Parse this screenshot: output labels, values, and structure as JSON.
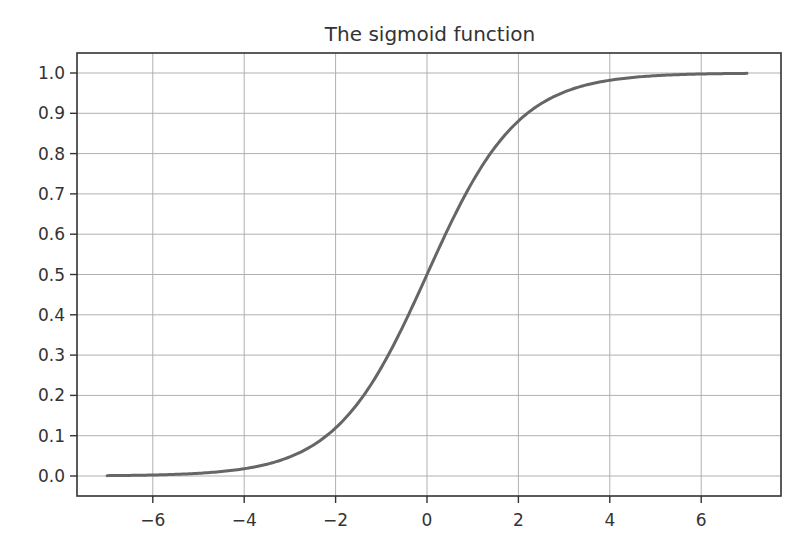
{
  "chart_data": {
    "type": "line",
    "title": "The sigmoid function",
    "xlabel": "",
    "ylabel": "",
    "xlim": [
      -7.5,
      7.6
    ],
    "ylim": [
      -0.05,
      1.05
    ],
    "grid": true,
    "legend": null,
    "x_ticks": [
      -6,
      -4,
      -2,
      0,
      2,
      4,
      6
    ],
    "x_tick_labels": [
      "−6",
      "−4",
      "−2",
      "0",
      "2",
      "4",
      "6"
    ],
    "y_ticks": [
      0.0,
      0.1,
      0.2,
      0.3,
      0.4,
      0.5,
      0.6,
      0.7,
      0.8,
      0.9,
      1.0
    ],
    "y_tick_labels": [
      "0.0",
      "0.1",
      "0.2",
      "0.3",
      "0.4",
      "0.5",
      "0.6",
      "0.7",
      "0.8",
      "0.9",
      "1.0"
    ],
    "series": [
      {
        "name": "sigmoid",
        "color": "#666666",
        "function": "1/(1+exp(-x))",
        "x": [
          -7,
          -6,
          -5,
          -4,
          -3,
          -2,
          -1,
          0,
          1,
          2,
          3,
          4,
          5,
          6,
          7
        ],
        "values": [
          0.001,
          0.002,
          0.007,
          0.018,
          0.047,
          0.119,
          0.269,
          0.5,
          0.731,
          0.881,
          0.953,
          0.982,
          0.993,
          0.998,
          0.999
        ]
      }
    ]
  },
  "colors": {
    "background": "#ffffff",
    "axes": "#333333",
    "grid": "#b0b0b0",
    "line": "#666666",
    "text": "#333333"
  }
}
